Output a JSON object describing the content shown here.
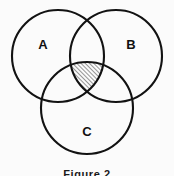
{
  "figure": {
    "caption": "Figure 2",
    "background_color": "#fbfbfb",
    "stroke_color": "#121212",
    "label_color": "#101010",
    "hatch_color": "#1a1a1a",
    "width": 174,
    "height": 176
  },
  "chart_data": {
    "type": "diagram",
    "diagram_type": "venn",
    "title": "Figure 2",
    "set_count": 3,
    "sets": [
      {
        "label": "A",
        "cx": 58,
        "cy": 56,
        "r": 46,
        "label_x": 43,
        "label_y": 46,
        "shaded": false
      },
      {
        "label": "B",
        "cx": 116,
        "cy": 56,
        "r": 46,
        "label_x": 131,
        "label_y": 46,
        "shaded": false
      },
      {
        "label": "C",
        "cx": 87,
        "cy": 108,
        "r": 46,
        "label_x": 87,
        "label_y": 133,
        "shaded": false
      }
    ],
    "shaded_regions": [
      {
        "name": "A-and-B-and-C",
        "members": [
          "A",
          "B",
          "C"
        ],
        "fill_style": "diagonal-hatch",
        "hatch_angle_deg": 45,
        "hatch_spacing_px": 3,
        "hatch_line_width_px": 0.9
      }
    ],
    "legend": null,
    "grid": false,
    "xlabel": "",
    "ylabel": ""
  }
}
